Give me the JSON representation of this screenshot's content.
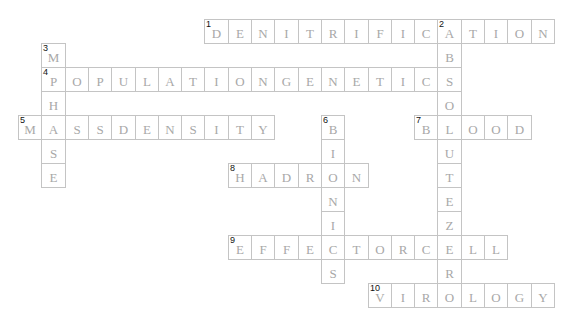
{
  "puzzle": {
    "grid": {
      "origin_x": 18,
      "origin_y": 19,
      "cell_width": 23.3,
      "cell_height": 24
    },
    "colors": {
      "letter": "#a8a8a8",
      "border": "#c4c4c4",
      "number": "#111111",
      "background": "#ffffff"
    },
    "entries": [
      {
        "number": "1",
        "direction": "across",
        "answer": "DENITRIFICATION",
        "row": 0,
        "col": 8
      },
      {
        "number": "2",
        "direction": "down",
        "answer": "ABSOLUTEZERO",
        "row": 0,
        "col": 18
      },
      {
        "number": "3",
        "direction": "down",
        "answer": "MPHASE",
        "row": 1,
        "col": 1
      },
      {
        "number": "4",
        "direction": "across",
        "answer": "POPULATIONGENETICS",
        "row": 2,
        "col": 1
      },
      {
        "number": "5",
        "direction": "across",
        "answer": "MASSDENSITY",
        "row": 4,
        "col": 0
      },
      {
        "number": "6",
        "direction": "down",
        "answer": "BIONICS",
        "row": 4,
        "col": 13
      },
      {
        "number": "7",
        "direction": "across",
        "answer": "BLOOD",
        "row": 4,
        "col": 17
      },
      {
        "number": "8",
        "direction": "across",
        "answer": "HADRON",
        "row": 6,
        "col": 9
      },
      {
        "number": "9",
        "direction": "across",
        "answer": "EFFECTORCELL",
        "row": 9,
        "col": 9
      },
      {
        "number": "10",
        "direction": "across",
        "answer": "VIROLOGY",
        "row": 11,
        "col": 15
      }
    ]
  }
}
